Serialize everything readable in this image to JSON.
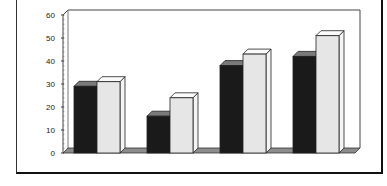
{
  "chart_data": {
    "type": "bar",
    "style": "3d-clustered-column",
    "title": "",
    "xlabel": "",
    "ylabel": "",
    "categories": [
      "1",
      "2",
      "3",
      "4"
    ],
    "series": [
      {
        "name": "Series 1",
        "color": "#1a1a1a",
        "values": [
          29,
          16,
          38,
          42
        ]
      },
      {
        "name": "Series 2",
        "color": "#e6e6e6",
        "values": [
          31,
          24,
          43,
          51
        ]
      }
    ],
    "ylim": [
      0,
      60
    ],
    "yticks": [
      "0",
      "10",
      "20",
      "30",
      "40",
      "50",
      "60"
    ],
    "grid": false,
    "legend": "none"
  },
  "colors": {
    "floor": "#8c8c8c",
    "axis": "#444444",
    "background": "#ffffff"
  }
}
